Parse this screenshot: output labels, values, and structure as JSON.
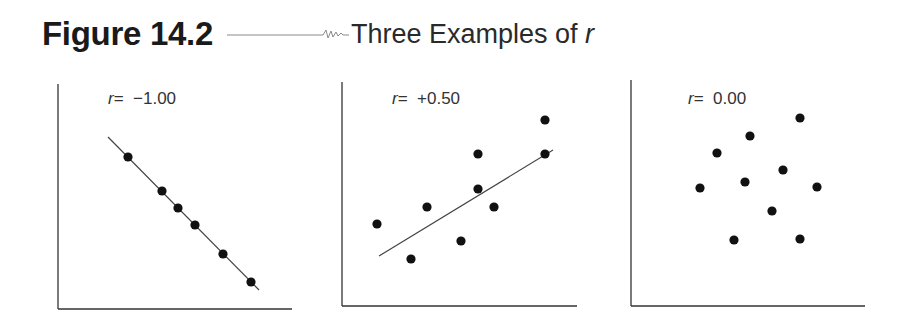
{
  "header": {
    "figure_label": "Figure 14.2",
    "caption": "Three Examples of ",
    "caption_var": "r"
  },
  "chart_data": [
    {
      "type": "scatter",
      "title": "r = -1.00",
      "label_var": "r",
      "label_value": "= −1.00",
      "r": -1.0,
      "xlabel": "",
      "ylabel": "",
      "grid": false,
      "trend_line": {
        "x1": 108,
        "y1": 137,
        "x2": 259,
        "y2": 290
      },
      "points_px": [
        [
          128,
          157
        ],
        [
          162,
          191
        ],
        [
          178,
          208
        ],
        [
          195,
          225
        ],
        [
          223,
          254
        ],
        [
          251,
          282
        ]
      ],
      "axes_px": {
        "x0": 58,
        "y0": 309,
        "xmax": 292,
        "ytop": 84
      }
    },
    {
      "type": "scatter",
      "title": "r = +0.50",
      "label_var": "r",
      "label_value": "= +0.50",
      "r": 0.5,
      "xlabel": "",
      "ylabel": "",
      "grid": false,
      "trend_line": {
        "x1": 379,
        "y1": 256,
        "x2": 553,
        "y2": 150
      },
      "points_px": [
        [
          377,
          224
        ],
        [
          411,
          259
        ],
        [
          427,
          207
        ],
        [
          461,
          241
        ],
        [
          478,
          154
        ],
        [
          478,
          189
        ],
        [
          494,
          207
        ],
        [
          545,
          120
        ],
        [
          545,
          154
        ]
      ],
      "axes_px": {
        "x0": 342,
        "y0": 306,
        "xmax": 577,
        "ytop": 82
      }
    },
    {
      "type": "scatter",
      "title": "r = 0.00",
      "label_var": "r",
      "label_value": "= 0.00",
      "r": 0.0,
      "xlabel": "",
      "ylabel": "",
      "grid": false,
      "trend_line": null,
      "points_px": [
        [
          700,
          188
        ],
        [
          717,
          153
        ],
        [
          734,
          240
        ],
        [
          745,
          182
        ],
        [
          750,
          136
        ],
        [
          772,
          211
        ],
        [
          783,
          170
        ],
        [
          800,
          118
        ],
        [
          800,
          239
        ],
        [
          817,
          187
        ]
      ],
      "axes_px": {
        "x0": 631,
        "y0": 306,
        "xmax": 865,
        "ytop": 80
      }
    }
  ]
}
